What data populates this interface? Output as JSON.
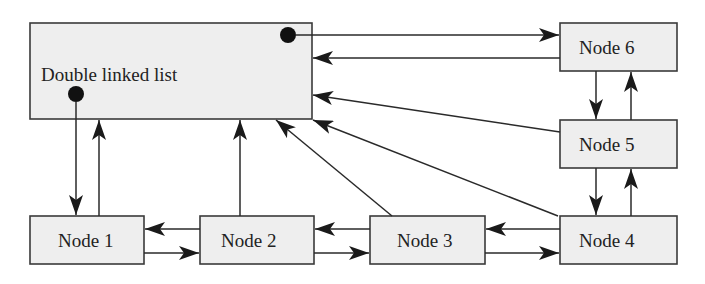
{
  "diagram": {
    "type": "doubly-linked-list-structure",
    "colors": {
      "box_fill": "#eeeeee",
      "stroke": "#2a2a2a",
      "dot": "#111111"
    },
    "nodes": {
      "list": {
        "label": "Double linked list",
        "x": 30,
        "y": 23,
        "w": 282,
        "h": 96
      },
      "node1": {
        "label": "Node 1",
        "x": 30,
        "y": 216,
        "w": 114,
        "h": 48
      },
      "node2": {
        "label": "Node 2",
        "x": 200,
        "y": 216,
        "w": 114,
        "h": 48
      },
      "node3": {
        "label": "Node 3",
        "x": 370,
        "y": 216,
        "w": 115,
        "h": 48
      },
      "node4": {
        "label": "Node 4",
        "x": 560,
        "y": 216,
        "w": 117,
        "h": 48
      },
      "node5": {
        "label": "Node 5",
        "x": 560,
        "y": 120,
        "w": 117,
        "h": 48
      },
      "node6": {
        "label": "Node 6",
        "x": 560,
        "y": 23,
        "w": 117,
        "h": 48
      }
    },
    "edges": [
      {
        "from": "list",
        "to": "node1",
        "kind": "head-pointer"
      },
      {
        "from": "node1",
        "to": "list",
        "kind": "owner"
      },
      {
        "from": "node2",
        "to": "list",
        "kind": "owner"
      },
      {
        "from": "node3",
        "to": "list",
        "kind": "owner"
      },
      {
        "from": "node4",
        "to": "list",
        "kind": "owner"
      },
      {
        "from": "node5",
        "to": "list",
        "kind": "owner"
      },
      {
        "from": "node6",
        "to": "list",
        "kind": "owner"
      },
      {
        "from": "list",
        "to": "node6",
        "kind": "tail-pointer"
      },
      {
        "from": "node1",
        "to": "node2",
        "kind": "next"
      },
      {
        "from": "node2",
        "to": "node1",
        "kind": "prev"
      },
      {
        "from": "node2",
        "to": "node3",
        "kind": "next"
      },
      {
        "from": "node3",
        "to": "node2",
        "kind": "prev"
      },
      {
        "from": "node3",
        "to": "node4",
        "kind": "next"
      },
      {
        "from": "node4",
        "to": "node3",
        "kind": "prev"
      },
      {
        "from": "node4",
        "to": "node5",
        "kind": "next"
      },
      {
        "from": "node5",
        "to": "node4",
        "kind": "prev"
      },
      {
        "from": "node5",
        "to": "node6",
        "kind": "next"
      },
      {
        "from": "node6",
        "to": "node5",
        "kind": "prev"
      }
    ]
  }
}
